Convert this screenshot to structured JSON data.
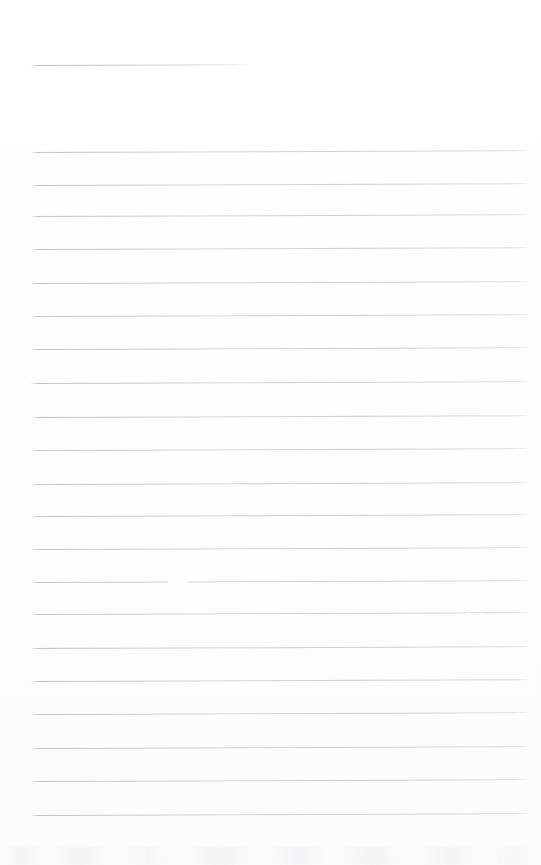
{
  "document": {
    "kind": "scanned-ruled-notepad-page",
    "width": 541,
    "height": 865,
    "background_color": "#fefefe",
    "has_visible_text": false,
    "text_content": "",
    "rule_color": "#c6c6cc"
  },
  "rules": {
    "count": 23,
    "left_x": 31,
    "full_right_x": 528,
    "spacing_px": 32.2,
    "items": [
      {
        "index": 0,
        "y": 65,
        "x1": 31,
        "x2": 250,
        "variant": "short"
      },
      {
        "index": 1,
        "y": 152,
        "x1": 31,
        "x2": 528,
        "variant": "full"
      },
      {
        "index": 2,
        "y": 185,
        "x1": 31,
        "x2": 528,
        "variant": "full"
      },
      {
        "index": 3,
        "y": 216,
        "x1": 31,
        "x2": 528,
        "variant": "full"
      },
      {
        "index": 4,
        "y": 249,
        "x1": 31,
        "x2": 528,
        "variant": "full"
      },
      {
        "index": 5,
        "y": 283,
        "x1": 31,
        "x2": 528,
        "variant": "full"
      },
      {
        "index": 6,
        "y": 316,
        "x1": 31,
        "x2": 528,
        "variant": "full"
      },
      {
        "index": 7,
        "y": 349,
        "x1": 31,
        "x2": 528,
        "variant": "full"
      },
      {
        "index": 8,
        "y": 383,
        "x1": 31,
        "x2": 528,
        "variant": "full"
      },
      {
        "index": 9,
        "y": 417,
        "x1": 31,
        "x2": 528,
        "variant": "full"
      },
      {
        "index": 10,
        "y": 450,
        "x1": 31,
        "x2": 528,
        "variant": "full"
      },
      {
        "index": 11,
        "y": 484,
        "x1": 31,
        "x2": 528,
        "variant": "full"
      },
      {
        "index": 12,
        "y": 516,
        "x1": 31,
        "x2": 528,
        "variant": "full"
      },
      {
        "index": 13,
        "y": 549,
        "x1": 31,
        "x2": 528,
        "variant": "full"
      },
      {
        "index": 14,
        "y": 582,
        "x1": 31,
        "x2": 528,
        "variant": "full"
      },
      {
        "index": 15,
        "y": 614,
        "x1": 31,
        "x2": 528,
        "variant": "full"
      },
      {
        "index": 16,
        "y": 648,
        "x1": 31,
        "x2": 528,
        "variant": "full"
      },
      {
        "index": 17,
        "y": 681,
        "x1": 31,
        "x2": 528,
        "variant": "full"
      },
      {
        "index": 18,
        "y": 714,
        "x1": 31,
        "x2": 528,
        "variant": "full"
      },
      {
        "index": 19,
        "y": 748,
        "x1": 31,
        "x2": 528,
        "variant": "full"
      },
      {
        "index": 20,
        "y": 781,
        "x1": 31,
        "x2": 528,
        "variant": "full"
      },
      {
        "index": 21,
        "y": 815,
        "x1": 31,
        "x2": 528,
        "variant": "full"
      }
    ]
  },
  "artifacts": {
    "line_gaps": [
      {
        "rule_index": 14,
        "y": 582,
        "x": 168,
        "width": 20
      },
      {
        "rule_index": 15,
        "y": 614,
        "x": 466,
        "width": 16
      }
    ],
    "bottom_smudge": {
      "y": 847,
      "height": 18,
      "description": "faint mottled grey scanner band along bottom edge"
    }
  }
}
